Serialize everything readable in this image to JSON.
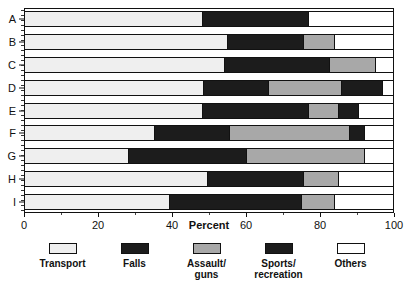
{
  "chart_data": {
    "type": "bar",
    "orientation": "horizontal",
    "stacked": true,
    "title": "",
    "xlabel": "Percent",
    "ylabel": "",
    "xlim": [
      0,
      100
    ],
    "xticks": [
      0,
      20,
      40,
      60,
      80,
      100
    ],
    "xtick_labels": [
      "0",
      "20",
      "40",
      "60",
      "80",
      "100"
    ],
    "grid": false,
    "legend_position": "bottom",
    "categories": [
      "A",
      "B",
      "C",
      "D",
      "E",
      "F",
      "G",
      "H",
      "I"
    ],
    "series": [
      {
        "name": "Transport",
        "values": [
          48,
          55,
          54,
          48.5,
          48,
          35,
          28,
          49.5,
          39
        ]
      },
      {
        "name": "Falls",
        "values": [
          29,
          20.5,
          28.5,
          17.5,
          29,
          20.5,
          32,
          26,
          36
        ]
      },
      {
        "name": "Assault/\nguns",
        "values": [
          0,
          8.5,
          12.5,
          20,
          8,
          32.5,
          32,
          9.5,
          9
        ]
      },
      {
        "name": "Sports/\nrecreation",
        "values": [
          0,
          0,
          0,
          11,
          5.5,
          4,
          0,
          0,
          0
        ]
      },
      {
        "name": "Others",
        "values": [
          23,
          16,
          5,
          3,
          9.5,
          8,
          8,
          15,
          16
        ]
      }
    ],
    "legend_entries": [
      {
        "label": "Transport",
        "color": "#efefef"
      },
      {
        "label": "Falls",
        "color": "#1c1c1c"
      },
      {
        "label": "Assault/\nguns",
        "color": "#a8a8a8"
      },
      {
        "label": "Sports/\nrecreation",
        "color": "#1c1c1c"
      },
      {
        "label": "Others",
        "color": "#ffffff"
      }
    ]
  },
  "axis": {
    "x_title": "Percent"
  }
}
